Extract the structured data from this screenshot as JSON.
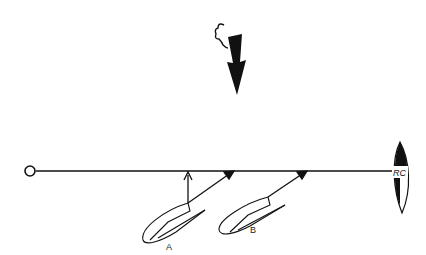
{
  "diagram": {
    "type": "sailing-start-line",
    "wind": {
      "icon": "wind-arrow-icon",
      "direction": "down"
    },
    "pin_end": {
      "icon": "pin-buoy-icon"
    },
    "committee_boat": {
      "label": "RC"
    },
    "boats": [
      {
        "label": "A"
      },
      {
        "label": "B"
      }
    ],
    "colors": {
      "ink": "#111111",
      "background": "#ffffff"
    }
  }
}
